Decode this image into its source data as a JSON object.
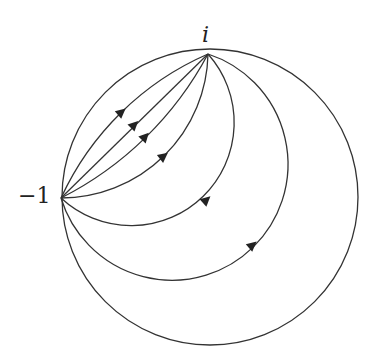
{
  "labels": {
    "top_point": "i",
    "left_point": "−1"
  },
  "diagram": {
    "type": "circle with family of oriented arcs",
    "points": [
      {
        "label": "i",
        "x": 208,
        "y": 54
      },
      {
        "label": "−1",
        "x": 61,
        "y": 198
      }
    ],
    "stroke_color": "#333333",
    "arc_count": 6
  }
}
